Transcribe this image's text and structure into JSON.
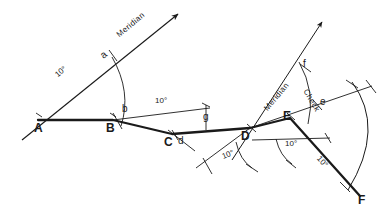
{
  "diagram": {
    "ink_color": "#1a1a1a",
    "background_color": "#ffffff",
    "stations": [
      {
        "id": "A",
        "label": "A",
        "x": 38,
        "y": 120,
        "label_x": 34,
        "label_y": 124
      },
      {
        "id": "B",
        "label": "B",
        "x": 113,
        "y": 120,
        "label_x": 107,
        "label_y": 124
      },
      {
        "id": "C",
        "label": "C",
        "x": 172,
        "y": 134,
        "label_x": 165,
        "label_y": 137
      },
      {
        "id": "D",
        "label": "D",
        "x": 250,
        "y": 128,
        "label_x": 243,
        "label_y": 132
      },
      {
        "id": "E",
        "label": "E",
        "x": 290,
        "y": 118,
        "label_x": 285,
        "label_y": 121
      },
      {
        "id": "F",
        "label": "F",
        "x": 360,
        "y": 196,
        "label_x": 358,
        "label_y": 199
      }
    ],
    "tick_points": [
      {
        "id": "a",
        "label": "a",
        "x": 112,
        "y": 56,
        "label_x": 104,
        "label_y": 58
      },
      {
        "id": "b",
        "label": "b",
        "x": 120,
        "y": 120,
        "label_x": 122,
        "label_y": 106
      },
      {
        "id": "d",
        "label": "d",
        "x": 181,
        "y": 137,
        "label_x": 179,
        "label_y": 136
      },
      {
        "id": "e",
        "label": "e",
        "x": 318,
        "y": 106,
        "label_x": 320,
        "label_y": 99
      },
      {
        "id": "f",
        "label": "f",
        "x": 305,
        "y": 70,
        "label_x": 305,
        "label_y": 63
      },
      {
        "id": "g",
        "label": "g",
        "x": 206,
        "y": 112,
        "label_x": 203,
        "label_y": 114
      }
    ],
    "angle_labels": [
      {
        "id": "angle-A",
        "text": "10°",
        "x": 62,
        "y": 73,
        "rotation": -40
      },
      {
        "id": "angle-BC",
        "text": "10°",
        "x": 158,
        "y": 101,
        "rotation": 0
      },
      {
        "id": "angle-D",
        "text": "10°",
        "x": 228,
        "y": 154,
        "rotation": -22
      },
      {
        "id": "angle-E",
        "text": "10°",
        "x": 289,
        "y": 143,
        "rotation": 0
      },
      {
        "id": "angle-EF",
        "text": "10°",
        "x": 321,
        "y": 162,
        "rotation": 48
      }
    ],
    "word_labels": [
      {
        "id": "meridian-left",
        "text": "Meridian",
        "x": 123,
        "y": 35,
        "rotation": -40
      },
      {
        "id": "meridian-right",
        "text": "Meridian",
        "x": 271,
        "y": 108,
        "rotation": -50
      },
      {
        "id": "check-right",
        "text": "Check",
        "x": 308,
        "y": 88,
        "rotation": 60
      }
    ],
    "traverse_legs": [
      {
        "from": "A",
        "to": "B"
      },
      {
        "from": "B",
        "to": "C"
      },
      {
        "from": "C",
        "to": "D"
      },
      {
        "from": "D",
        "to": "E"
      },
      {
        "from": "E",
        "to": "F"
      }
    ]
  }
}
